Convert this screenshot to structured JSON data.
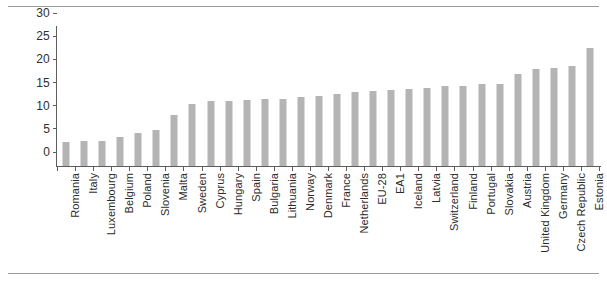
{
  "chart_data": {
    "type": "bar",
    "title": "",
    "subtitle": "",
    "xlabel": "",
    "ylabel": "",
    "ylim": [
      0,
      30
    ],
    "yticks": [
      0,
      5,
      10,
      15,
      20,
      25,
      30
    ],
    "grid": false,
    "legend": null,
    "legend_position": "none",
    "bar_color": "#b4b4b4",
    "axis_color": "#5d5d5d",
    "categories": [
      "Romania",
      "Italy",
      "Luxembourg",
      "Belgium",
      "Poland",
      "Slovenia",
      "Malta",
      "Sweden",
      "Cyprus",
      "Hungary",
      "Spain",
      "Bulgaria",
      "Lithuania",
      "Norway",
      "Denmark",
      "France",
      "Netherlands",
      "EU-28",
      "EA1",
      "Iceland",
      "Latvia",
      "Switzerland",
      "Finland",
      "Portugal",
      "Slovakia",
      "Austria",
      "United Kingdom",
      "Germany",
      "Czech Republic",
      "Estonia"
    ],
    "values": [
      5.2,
      5.3,
      5.5,
      6.2,
      7.2,
      7.8,
      11.0,
      13.3,
      14.0,
      14.0,
      14.2,
      14.4,
      14.4,
      14.8,
      15.1,
      15.5,
      16.0,
      16.2,
      16.3,
      16.6,
      16.8,
      17.2,
      17.3,
      17.6,
      17.8,
      19.8,
      20.9,
      21.2,
      21.5,
      25.4
    ]
  }
}
